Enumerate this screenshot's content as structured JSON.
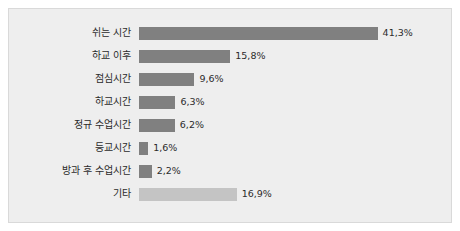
{
  "chart_data": {
    "type": "bar",
    "orientation": "horizontal",
    "title": "",
    "xlabel": "",
    "ylabel": "",
    "xlim": [
      0,
      45
    ],
    "grid": false,
    "legend": null,
    "value_suffix": "%",
    "decimal_separator": ",",
    "categories": [
      "쉬는 시간",
      "하교 이후",
      "점심시간",
      "하교시간",
      "정규 수업시간",
      "등교시간",
      "방과 후 수업시간",
      "기타"
    ],
    "values": [
      41.3,
      15.8,
      9.6,
      6.3,
      6.2,
      1.6,
      2.2,
      16.9
    ],
    "value_labels": [
      "41,3%",
      "15,8%",
      "9,6%",
      "6,3%",
      "6,2%",
      "1,6%",
      "2,2%",
      "16,9%"
    ],
    "bar_colors": [
      "#808080",
      "#808080",
      "#808080",
      "#808080",
      "#808080",
      "#808080",
      "#808080",
      "#c4c4c4"
    ]
  },
  "style": {
    "plot_background": "#eeeeee",
    "page_background": "#ffffff",
    "border_color": "#d9d9d9",
    "text_color": "#2b2b2b"
  }
}
